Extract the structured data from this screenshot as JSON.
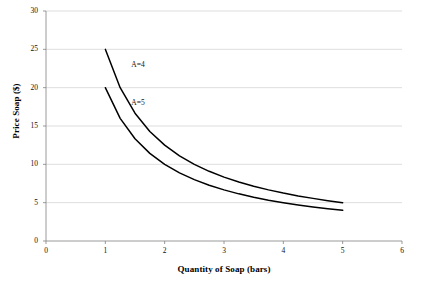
{
  "chart_data": {
    "type": "line",
    "title": "",
    "xlabel": "Quantity of Soap (bars)",
    "ylabel": "Price Soap ($)",
    "xlim": [
      0,
      6
    ],
    "ylim": [
      0,
      30
    ],
    "xticks": [
      "0",
      "1",
      "2",
      "3",
      "4",
      "5",
      "6"
    ],
    "yticks": [
      "0",
      "5",
      "10",
      "15",
      "20",
      "25",
      "30"
    ],
    "grid": "horizontal",
    "legend_position": "inline-annotations",
    "series": [
      {
        "name": "A=4",
        "label": "A=4",
        "color": "#000000",
        "equation": "P = 25 / Q",
        "x": [
          1.0,
          1.25,
          1.5,
          1.75,
          2.0,
          2.25,
          2.5,
          2.75,
          3.0,
          3.25,
          3.5,
          3.75,
          4.0,
          4.25,
          4.5,
          4.75,
          5.0
        ],
        "values": [
          25.0,
          20.0,
          16.67,
          14.29,
          12.5,
          11.11,
          10.0,
          9.09,
          8.33,
          7.69,
          7.14,
          6.67,
          6.25,
          5.88,
          5.56,
          5.26,
          5.0
        ]
      },
      {
        "name": "A=5",
        "label": "A=5",
        "color": "#000000",
        "equation": "P = 20 / Q",
        "x": [
          1.0,
          1.25,
          1.5,
          1.75,
          2.0,
          2.25,
          2.5,
          2.75,
          3.0,
          3.25,
          3.5,
          3.75,
          4.0,
          4.25,
          4.5,
          4.75,
          5.0
        ],
        "values": [
          20.0,
          16.0,
          13.33,
          11.43,
          10.0,
          8.89,
          8.0,
          7.27,
          6.67,
          6.15,
          5.71,
          5.33,
          5.0,
          4.71,
          4.44,
          4.21,
          4.0
        ]
      }
    ],
    "annotations": [
      {
        "text": "A=4",
        "x": 1.0,
        "y": 23.0
      },
      {
        "text": "A=5",
        "x": 1.0,
        "y": 18.0
      }
    ],
    "colors": {
      "curve": "#000000",
      "gridline": "#c8c8c8",
      "axis": "#808080",
      "background": "#ffffff"
    }
  }
}
